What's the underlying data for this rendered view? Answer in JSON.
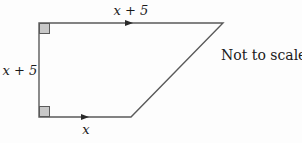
{
  "diagram": {
    "type": "trapezium",
    "vertices": {
      "top_left": [
        39,
        23
      ],
      "top_right": [
        223,
        23
      ],
      "bottom_right": [
        131,
        117
      ],
      "bottom_left": [
        39,
        117
      ]
    },
    "labels": {
      "top_side": "x + 5",
      "left_side": "x + 5",
      "bottom_side": "x",
      "note": "Not to scale"
    },
    "right_angles": [
      "top_left",
      "bottom_left"
    ],
    "parallel_arrows": [
      "top_side",
      "bottom_side"
    ],
    "colors": {
      "line": "#5a5a5a",
      "right_angle_fill": "#c8c8c8",
      "text": "#1a1a1a",
      "background": "#fdfdfd"
    }
  }
}
